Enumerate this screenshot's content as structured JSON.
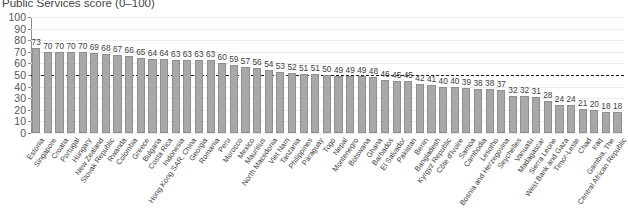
{
  "chart_data": {
    "type": "bar",
    "title": "Public Services score (0–100)",
    "xlabel": "",
    "ylabel": "",
    "ylim": [
      0,
      100
    ],
    "ytick_values": [
      0,
      10,
      20,
      30,
      40,
      50,
      60,
      70,
      80,
      90,
      100
    ],
    "ytick_labels": [
      "0",
      "10",
      "20",
      "30",
      "40",
      "50",
      "60",
      "70",
      "80",
      "90",
      "100"
    ],
    "grid": true,
    "legend": "none",
    "reference_line": {
      "value": 50,
      "style": "dashed",
      "color": "#1a1a1a"
    },
    "bar_color": "#a8a8a8",
    "bar_edge_color": "#8f8f8f",
    "categories": [
      "Estonia",
      "Singapore",
      "Croatia",
      "Portugal",
      "Hungary",
      "New Zealand",
      "Slovak Republic",
      "Rwanda",
      "Colombia",
      "Greece",
      "Bulgaria",
      "Costa Rica",
      "Indonesia",
      "Hong Kong SAR, China",
      "Georgia",
      "Romania",
      "Peru",
      "Morocco",
      "Mexico",
      "Mauritius",
      "North Macedonia",
      "Viet Nam",
      "Tanzania",
      "Philippines",
      "Paraguay",
      "Togo",
      "Nepal",
      "Montenegro",
      "Botswana",
      "Ghana",
      "Barbados",
      "El Salvador",
      "Pakistan",
      "Benin",
      "Bangladesh",
      "Kyrgyz Republic",
      "Côte d'Ivoire",
      "Samoa",
      "Cambodia",
      "Lesotho",
      "Bosnia and Herzegovina",
      "Seychelles",
      "Vanuatu",
      "Madagascar",
      "Sierra Leone",
      "West Bank and Gaza",
      "Timor-Leste",
      "Chad",
      "Iraq",
      "Gambia, The",
      "Central African Republic"
    ],
    "values": [
      73,
      70,
      70,
      70,
      70,
      69,
      68,
      67,
      66,
      65,
      64,
      64,
      63,
      63,
      63,
      63,
      60,
      59,
      57,
      56,
      54,
      53,
      52,
      51,
      51,
      50,
      49,
      49,
      49,
      48,
      46,
      45,
      45,
      42,
      41,
      40,
      40,
      39,
      38,
      38,
      37,
      32,
      32,
      31,
      28,
      24,
      24,
      21,
      20,
      18,
      18
    ]
  }
}
